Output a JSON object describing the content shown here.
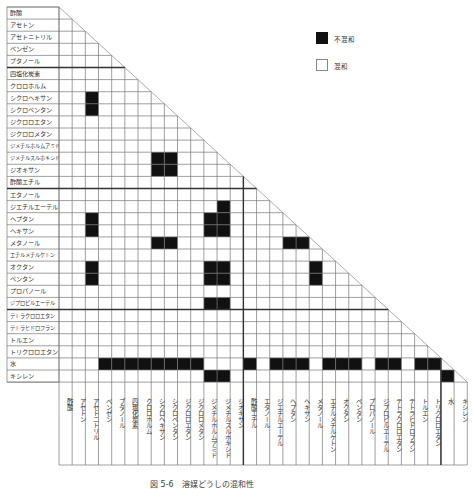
{
  "chart_data": {
    "type": "table",
    "caption": "図 5-6　溶媒どうしの混和性",
    "solvents": [
      "酢酸",
      "アセトン",
      "アセトニトリル",
      "ベンゼン",
      "ブタノール",
      "四塩化炭素",
      "クロロホルム",
      "シクロヘキサン",
      "シクロペンタン",
      "ジクロロエタン",
      "ジクロロメタン",
      "ジメチルホルムアミド",
      "ジメチルスルホキシド",
      "ジオキサン",
      "酢酸エチル",
      "エタノール",
      "ジエチルエーテル",
      "ヘプタン",
      "ヘキサン",
      "メタノール",
      "エチルメチルケトン",
      "オクタン",
      "ペンタン",
      "プロパノール",
      "ジプロピルエーテル",
      "テトラクロロエタン",
      "テトラヒドロフラン",
      "トルエン",
      "トリクロロエタン",
      "水",
      "キシレン"
    ],
    "legend": [
      {
        "label": "不混和",
        "color": "#111111"
      },
      {
        "label": "混和",
        "color": "#ffffff"
      }
    ],
    "immiscible_pairs": [
      [
        "シクロヘキサン",
        "アセトニトリル"
      ],
      [
        "シクロペンタン",
        "アセトニトリル"
      ],
      [
        "ジメチルスルホキシド",
        "シクロヘキサン"
      ],
      [
        "ジメチルスルホキシド",
        "シクロペンタン"
      ],
      [
        "ジオキサン",
        "シクロヘキサン"
      ],
      [
        "ジオキサン",
        "シクロペンタン"
      ],
      [
        "ジエチルエーテル",
        "ジメチルスルホキシド"
      ],
      [
        "ヘプタン",
        "アセトニトリル"
      ],
      [
        "ヘプタン",
        "ジメチルホルムアミド"
      ],
      [
        "ヘプタン",
        "ジメチルスルホキシド"
      ],
      [
        "ヘキサン",
        "アセトニトリル"
      ],
      [
        "ヘキサン",
        "ジメチルホルムアミド"
      ],
      [
        "ヘキサン",
        "ジメチルスルホキシド"
      ],
      [
        "メタノール",
        "シクロヘキサン"
      ],
      [
        "メタノール",
        "シクロペンタン"
      ],
      [
        "メタノール",
        "ヘプタン"
      ],
      [
        "メタノール",
        "ヘキサン"
      ],
      [
        "オクタン",
        "アセトニトリル"
      ],
      [
        "オクタン",
        "ジメチルホルムアミド"
      ],
      [
        "オクタン",
        "ジメチルスルホキシド"
      ],
      [
        "オクタン",
        "メタノール"
      ],
      [
        "ペンタン",
        "アセトニトリル"
      ],
      [
        "ペンタン",
        "ジメチルホルムアミド"
      ],
      [
        "ペンタン",
        "ジメチルスルホキシド"
      ],
      [
        "ペンタン",
        "メタノール"
      ],
      [
        "ジプロピルエーテル",
        "ジメチルホルムアミド"
      ],
      [
        "ジプロピルエーテル",
        "ジメチルスルホキシド"
      ],
      [
        "水",
        "ベンゼン"
      ],
      [
        "水",
        "ブタノール"
      ],
      [
        "水",
        "四塩化炭素"
      ],
      [
        "水",
        "クロロホルム"
      ],
      [
        "水",
        "シクロヘキサン"
      ],
      [
        "水",
        "シクロペンタン"
      ],
      [
        "水",
        "ジクロロエタン"
      ],
      [
        "水",
        "ジクロロメタン"
      ],
      [
        "水",
        "酢酸エチル"
      ],
      [
        "水",
        "ジエチルエーテル"
      ],
      [
        "水",
        "ヘプタン"
      ],
      [
        "水",
        "ヘキサン"
      ],
      [
        "水",
        "エチルメチルケトン"
      ],
      [
        "水",
        "オクタン"
      ],
      [
        "水",
        "ペンタン"
      ],
      [
        "水",
        "ジプロピルエーテル"
      ],
      [
        "水",
        "テトラクロロエタン"
      ],
      [
        "水",
        "トルエン"
      ],
      [
        "水",
        "トリクロロエタン"
      ],
      [
        "キシレン",
        "ジメチルホルムアミド"
      ],
      [
        "キシレン",
        "ジメチルスルホキシド"
      ],
      [
        "キシレン",
        "水"
      ]
    ],
    "immiscible_cells": [
      [
        7,
        2
      ],
      [
        8,
        2
      ],
      [
        12,
        7
      ],
      [
        12,
        8
      ],
      [
        13,
        7
      ],
      [
        13,
        8
      ],
      [
        16,
        12
      ],
      [
        17,
        2
      ],
      [
        17,
        11
      ],
      [
        17,
        12
      ],
      [
        18,
        2
      ],
      [
        18,
        11
      ],
      [
        18,
        12
      ],
      [
        19,
        7
      ],
      [
        19,
        8
      ],
      [
        19,
        17
      ],
      [
        19,
        18
      ],
      [
        21,
        2
      ],
      [
        21,
        11
      ],
      [
        21,
        12
      ],
      [
        21,
        19
      ],
      [
        22,
        2
      ],
      [
        22,
        11
      ],
      [
        22,
        12
      ],
      [
        22,
        19
      ],
      [
        24,
        11
      ],
      [
        24,
        12
      ],
      [
        29,
        3
      ],
      [
        29,
        4
      ],
      [
        29,
        5
      ],
      [
        29,
        6
      ],
      [
        29,
        7
      ],
      [
        29,
        8
      ],
      [
        29,
        9
      ],
      [
        29,
        10
      ],
      [
        29,
        14
      ],
      [
        29,
        16
      ],
      [
        29,
        17
      ],
      [
        29,
        18
      ],
      [
        29,
        20
      ],
      [
        29,
        21
      ],
      [
        29,
        22
      ],
      [
        29,
        24
      ],
      [
        29,
        25
      ],
      [
        29,
        27
      ],
      [
        29,
        28
      ],
      [
        30,
        11
      ],
      [
        30,
        12
      ],
      [
        30,
        29
      ]
    ],
    "group_separators_after_index": [
      4,
      14,
      24
    ],
    "vertical_separators_before_col": [
      14,
      29
    ]
  }
}
